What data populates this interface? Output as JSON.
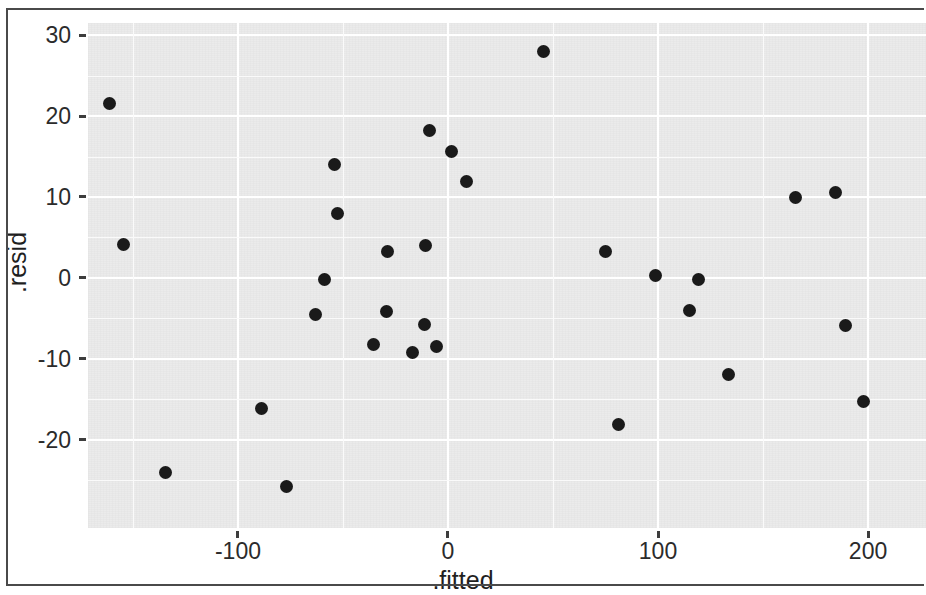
{
  "chart_data": {
    "type": "scatter",
    "title": "",
    "subtitle": "",
    "xlabel": ".fitted",
    "ylabel": ".resid",
    "xticks": [
      -100,
      0,
      100,
      200
    ],
    "xtick_labels": [
      "-100",
      "0",
      "100",
      "200"
    ],
    "yticks": [
      30,
      20,
      10,
      0,
      -10,
      -20
    ],
    "ytick_labels": [
      "30",
      "20",
      "10",
      "0",
      "-10",
      "-20"
    ],
    "xlim": [
      -171.4,
      227.6
    ],
    "ylim": [
      -30.9,
      31.5
    ],
    "grid": true,
    "grid_major_color": "#ffffff",
    "panel_background": "#ebebeb",
    "point_color": "#1a1a1a",
    "legend": null,
    "legend_position": "none",
    "x": [
      -161,
      -154.3,
      -134.3,
      -89,
      -76.7,
      -63.3,
      -58.6,
      -53.8,
      -52.4,
      -35.7,
      -29.5,
      -28.6,
      -16.7,
      -11,
      -10.5,
      -8.6,
      -5.7,
      1.9,
      9,
      45.7,
      75.2,
      81,
      99,
      115.2,
      119.5,
      133.8,
      165.7,
      184.3,
      189.5,
      198
    ],
    "y": [
      21.6,
      4.1,
      -24.1,
      -16.1,
      -25.8,
      -4.5,
      -0.2,
      14.0,
      7.9,
      -8.2,
      -4.2,
      3.3,
      -9.2,
      -5.8,
      4.0,
      18.2,
      -8.5,
      15.6,
      11.9,
      28.0,
      3.3,
      -18.1,
      0.35,
      -4.0,
      -0.2,
      -11.9,
      9.9,
      10.6,
      -5.9,
      -15.3
    ],
    "n_points": 30,
    "xminor": [
      -150,
      -50,
      50,
      150
    ],
    "yminor": [
      25,
      15,
      5,
      -5,
      -15,
      -25
    ]
  }
}
